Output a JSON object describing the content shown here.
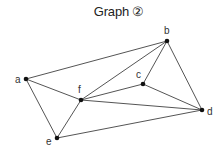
{
  "title": "Graph ②",
  "diagram": {
    "type": "graph",
    "nodes": [
      {
        "id": "a",
        "label": "a",
        "x": 26,
        "y": 79,
        "lx": 15,
        "ly": 83
      },
      {
        "id": "b",
        "label": "b",
        "x": 167,
        "y": 41,
        "lx": 164,
        "ly": 34
      },
      {
        "id": "c",
        "label": "c",
        "x": 143,
        "y": 84,
        "lx": 136,
        "ly": 78
      },
      {
        "id": "d",
        "label": "d",
        "x": 202,
        "y": 110,
        "lx": 207,
        "ly": 115
      },
      {
        "id": "e",
        "label": "e",
        "x": 57,
        "y": 138,
        "lx": 46,
        "ly": 145
      },
      {
        "id": "f",
        "label": "f",
        "x": 81,
        "y": 100,
        "lx": 78,
        "ly": 93
      }
    ],
    "edges": [
      [
        "a",
        "b"
      ],
      [
        "a",
        "f"
      ],
      [
        "a",
        "e"
      ],
      [
        "b",
        "f"
      ],
      [
        "b",
        "c"
      ],
      [
        "b",
        "d"
      ],
      [
        "c",
        "f"
      ],
      [
        "c",
        "d"
      ],
      [
        "f",
        "d"
      ],
      [
        "f",
        "e"
      ],
      [
        "e",
        "d"
      ]
    ],
    "colors": {
      "edge": "#555555",
      "node": "#111111",
      "label": "#333333"
    }
  }
}
